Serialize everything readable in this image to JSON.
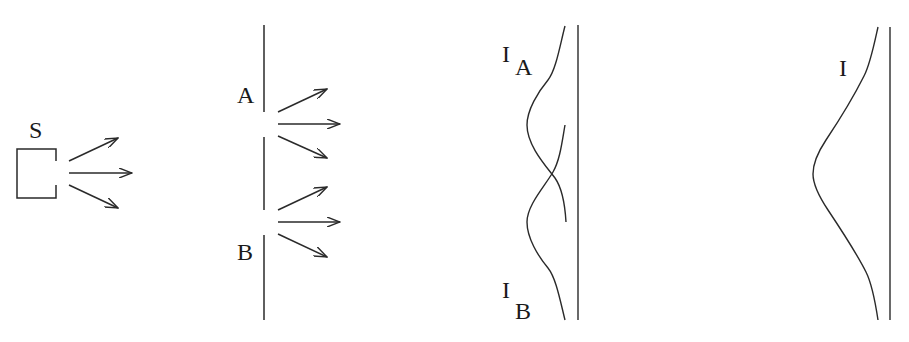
{
  "diagram": {
    "ink_color": "#2a2a2a",
    "source": {
      "label": "S"
    },
    "barrier": {
      "slit_a_label": "A",
      "slit_b_label": "B"
    },
    "individual_screen": {
      "curve_a_label_main": "I",
      "curve_a_label_sub": "A",
      "curve_b_label_main": "I",
      "curve_b_label_sub": "B"
    },
    "combined_screen": {
      "curve_label": "I"
    }
  }
}
